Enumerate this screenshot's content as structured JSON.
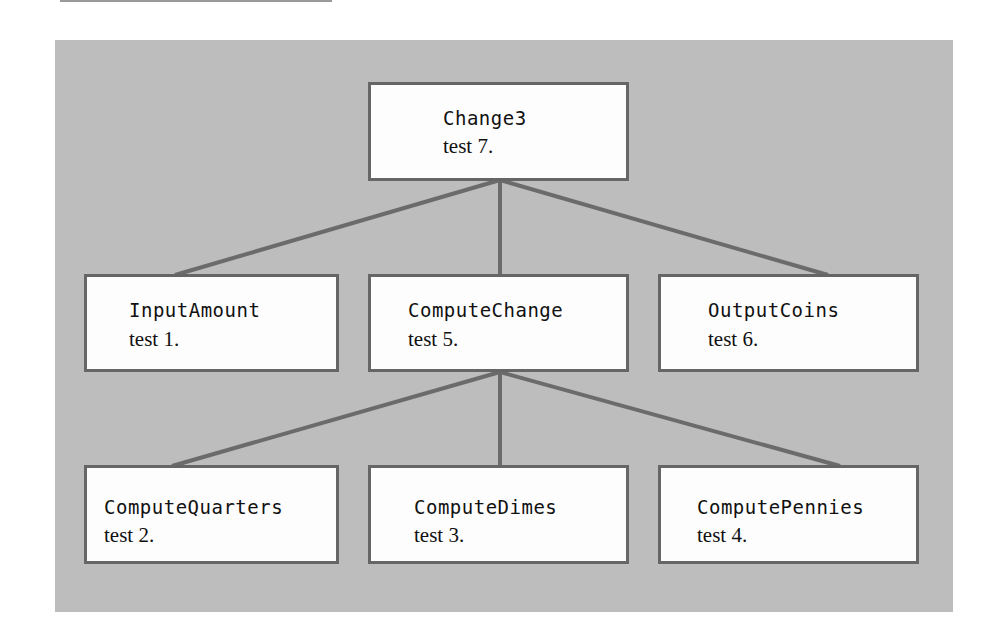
{
  "diagram": {
    "type": "structure-chart",
    "colors": {
      "panel_background": "#bdbdbd",
      "box_fill": "#fdfdfd",
      "box_border": "#666666",
      "connector": "#6b6b6b",
      "text": "#111111"
    },
    "nodes": {
      "root": {
        "name": "Change3",
        "test": "test 7."
      },
      "input": {
        "name": "InputAmount",
        "test": "test 1."
      },
      "compute": {
        "name": "ComputeChange",
        "test": "test 5."
      },
      "output": {
        "name": "OutputCoins",
        "test": "test 6."
      },
      "quarters": {
        "name": "ComputeQuarters",
        "test": "test 2."
      },
      "dimes": {
        "name": "ComputeDimes",
        "test": "test 3."
      },
      "pennies": {
        "name": "ComputePennies",
        "test": "test 4."
      }
    },
    "edges": [
      {
        "from": "Change3",
        "to": "InputAmount"
      },
      {
        "from": "Change3",
        "to": "ComputeChange"
      },
      {
        "from": "Change3",
        "to": "OutputCoins"
      },
      {
        "from": "ComputeChange",
        "to": "ComputeQuarters"
      },
      {
        "from": "ComputeChange",
        "to": "ComputeDimes"
      },
      {
        "from": "ComputeChange",
        "to": "ComputePennies"
      }
    ]
  }
}
